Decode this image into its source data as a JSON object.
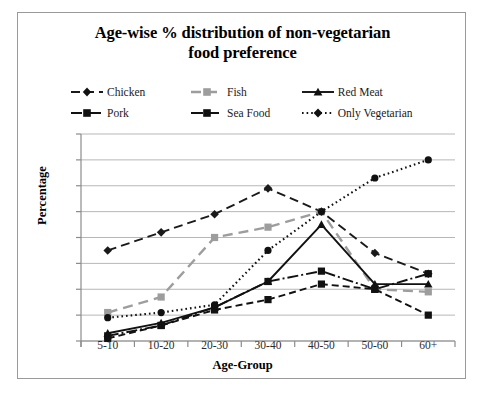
{
  "chart_data": {
    "type": "line",
    "title": "Age-wise % distribution of non-vegetarian food preference",
    "title_line1": "Age-wise % distribution of non-vegetarian",
    "title_line2": "food preference",
    "xlabel": "Age-Group",
    "ylabel": "Percentage",
    "categories": [
      "5-10",
      "10-20",
      "20-30",
      "30-40",
      "40-50",
      "50-60",
      "60+"
    ],
    "ylim": [
      0,
      80
    ],
    "yticks": [
      0,
      10,
      20,
      30,
      40,
      50,
      60,
      70,
      80
    ],
    "grid": true,
    "legend_position": "top",
    "series": [
      {
        "name": "Chicken",
        "values": [
          35,
          42,
          49,
          59,
          50,
          34,
          26
        ],
        "color": "#1a1a1a",
        "dash": "9,5",
        "marker": "diamond",
        "width": 1.9
      },
      {
        "name": "Fish",
        "values": [
          11,
          17,
          40,
          44,
          50,
          20,
          19
        ],
        "color": "#9d9d9d",
        "dash": "10,6",
        "marker": "square",
        "width": 2.4
      },
      {
        "name": "Red Meat",
        "values": [
          3,
          7,
          13,
          23,
          45,
          22,
          22
        ],
        "color": "#111111",
        "dash": "none",
        "marker": "triangle",
        "width": 1.9
      },
      {
        "name": "Pork",
        "values": [
          2,
          6,
          13,
          23,
          27,
          20,
          26
        ],
        "color": "#111111",
        "dash": "11,3,2,3",
        "marker": "square",
        "width": 1.9
      },
      {
        "name": "Sea Food",
        "values": [
          1,
          6,
          12,
          16,
          22,
          20,
          10
        ],
        "color": "#111111",
        "dash": "7,4",
        "marker": "square",
        "width": 1.9
      },
      {
        "name": "Only Vegetarian",
        "values": [
          9,
          11,
          14,
          35,
          50,
          63,
          70
        ],
        "color": "#111111",
        "dash": "1.6,3",
        "marker": "circle",
        "width": 2.1
      }
    ]
  },
  "axis": {
    "y_title": "Percentage",
    "x_title": "Age-Group",
    "y_tick_labels": [
      "80",
      "70",
      "60",
      "50",
      "40",
      "30",
      "20",
      "10",
      "0"
    ],
    "x_tick_labels": [
      "5-10",
      "10-20",
      "20-30",
      "30-40",
      "40-50",
      "50-60",
      "60+"
    ]
  },
  "legend": {
    "row1": [
      {
        "label": "Chicken",
        "icon": "dashed-diamond-marker-icon"
      },
      {
        "label": "Fish",
        "icon": "gray-dashed-square-marker-icon"
      },
      {
        "label": "Red Meat",
        "icon": "solid-triangle-marker-icon"
      }
    ],
    "row2": [
      {
        "label": "Pork",
        "icon": "dashdot-square-marker-icon"
      },
      {
        "label": "Sea Food",
        "icon": "dashed-square-marker-icon"
      },
      {
        "label": "Only Vegetarian",
        "icon": "dotted-diamond-marker-icon"
      }
    ]
  },
  "colors": {
    "plot_background": "#ffffff",
    "frame_border": "#9a9a9a",
    "gridline": "#b7b7b7",
    "axis_line": "#8c8c8c",
    "text": "#1a1a1a",
    "fish_gray": "#9d9d9d"
  }
}
